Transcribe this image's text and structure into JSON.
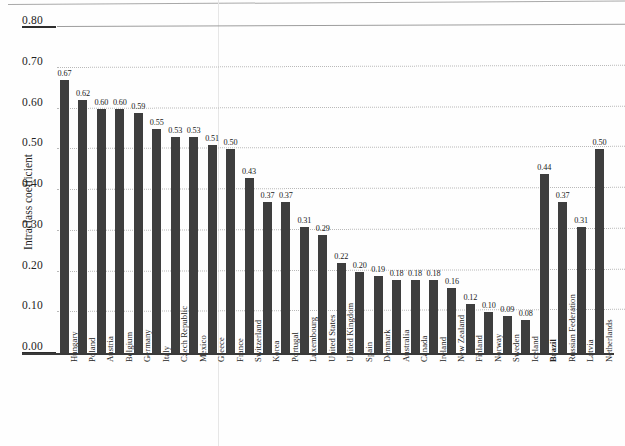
{
  "chart_data": {
    "type": "bar",
    "title": "",
    "subtitle": "",
    "xlabel": "",
    "ylabel": "Intraclass coefficient",
    "ylim": [
      0.0,
      0.8
    ],
    "yticks": [
      "0.00",
      "0.10",
      "0.20",
      "0.30",
      "0.40",
      "0.50",
      "0.60",
      "0.70",
      "0.80"
    ],
    "ytick_values": [
      0.0,
      0.1,
      0.2,
      0.3,
      0.4,
      0.5,
      0.6,
      0.7,
      0.8
    ],
    "grid": "horizontal-dotted",
    "legend": "none",
    "bar_color": "#3e3e3e",
    "categories": [
      "Hungary",
      "Poland",
      "Austria",
      "Belgium",
      "Germany",
      "Italy",
      "Czech Republic",
      "Mexico",
      "Greece",
      "France",
      "Switzerland",
      "Korea",
      "Portugal",
      "Luxembourg",
      "United States",
      "United Kingdom",
      "Spain",
      "Denmark",
      "Australia",
      "Canada",
      "Ireland",
      "New Zealand",
      "Finland",
      "Norway",
      "Sweden",
      "Iceland",
      "Brazil",
      "Russian Federation",
      "Latvia",
      "Netherlands"
    ],
    "values": [
      0.67,
      0.62,
      0.6,
      0.6,
      0.59,
      0.55,
      0.53,
      0.53,
      0.51,
      0.5,
      0.43,
      0.37,
      0.37,
      0.31,
      0.29,
      0.22,
      0.2,
      0.19,
      0.18,
      0.18,
      0.18,
      0.16,
      0.12,
      0.1,
      0.09,
      0.08,
      0.44,
      0.37,
      0.31,
      0.5
    ],
    "data_labels": [
      "0.67",
      "0.62",
      "0.60",
      "0.60",
      "0.59",
      "0.55",
      "0.53",
      "0.53",
      "0.51",
      "0.50",
      "0.43",
      "0.37",
      "0.37",
      "0.31",
      "0.29",
      "0.22",
      "0.20",
      "0.19",
      "0.18",
      "0.18",
      "0.18",
      "0.16",
      "0.12",
      "0.10",
      "0.09",
      "0.08",
      "0.44",
      "0.37",
      "0.31",
      "0.50"
    ],
    "bold_categories": [
      "Brazil"
    ],
    "group_break_after_index": 25
  }
}
